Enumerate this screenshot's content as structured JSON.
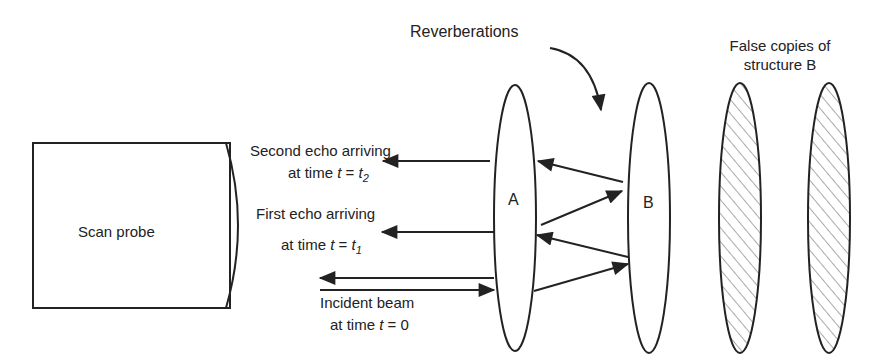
{
  "diagram": {
    "title_labels": {
      "reverberations": "Reverberations",
      "false_copies_line1": "False copies of",
      "false_copies_line2": "structure B"
    },
    "probe": {
      "label": "Scan probe"
    },
    "structures": {
      "a_label": "A",
      "b_label": "B"
    },
    "echoes": {
      "second": {
        "line1": "Second echo arriving",
        "line2_prefix": "at time ",
        "var": "t",
        "eq": " = ",
        "val": "t",
        "sub": "2"
      },
      "first": {
        "line1": "First echo arriving",
        "line2_prefix": "at time ",
        "var": "t",
        "eq": " = ",
        "val": "t",
        "sub": "1"
      },
      "incident": {
        "line1": "Incident beam",
        "line2_prefix": "at time ",
        "var": "t",
        "eq": " = ",
        "val": "0"
      }
    },
    "colors": {
      "stroke": "#222222",
      "background": "#ffffff"
    }
  }
}
